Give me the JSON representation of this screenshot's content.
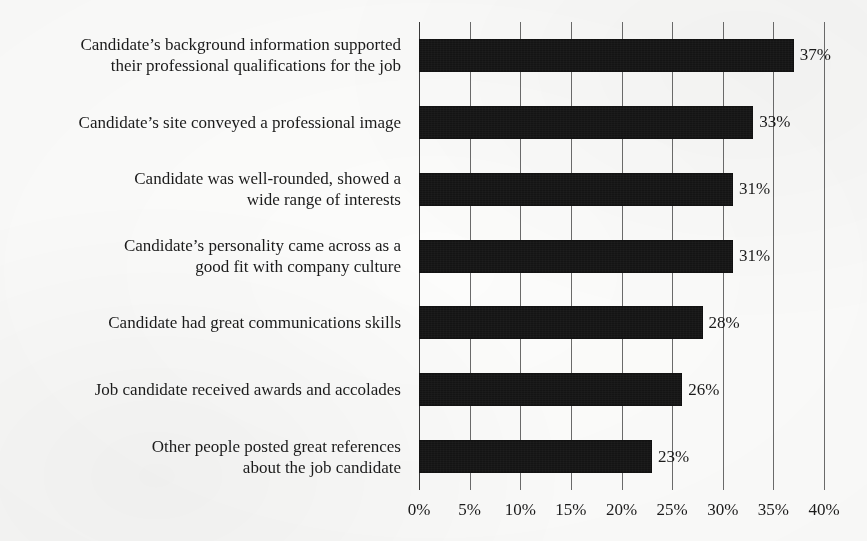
{
  "chart_data": {
    "type": "bar",
    "orientation": "horizontal",
    "title": "",
    "xlabel": "",
    "ylabel": "",
    "xlim": [
      0,
      40
    ],
    "xtick_labels": [
      "0%",
      "5%",
      "10%",
      "15%",
      "20%",
      "25%",
      "30%",
      "35%",
      "40%"
    ],
    "xtick_values": [
      0,
      5,
      10,
      15,
      20,
      25,
      30,
      35,
      40
    ],
    "grid": "vertical",
    "legend": "none",
    "bar_color": "#141414",
    "categories": [
      "Candidate’s background information supported\ntheir professional qualifications for the job",
      "Candidate’s site conveyed a professional image",
      "Candidate was well-rounded, showed a\nwide range of interests",
      "Candidate’s personality came across as a\ngood fit with company culture",
      "Candidate had great communications skills",
      "Job candidate received awards and accolades",
      "Other people posted great references\nabout the job candidate"
    ],
    "values": [
      37,
      33,
      31,
      31,
      28,
      26,
      23
    ],
    "value_labels": [
      "37%",
      "33%",
      "31%",
      "31%",
      "28%",
      "26%",
      "23%"
    ]
  }
}
